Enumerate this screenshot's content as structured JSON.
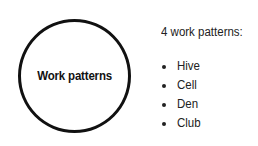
{
  "diagram": {
    "center_node": {
      "label": "Work patterns",
      "shape": "circle",
      "border_color": "#111111"
    },
    "heading": "4 work patterns:",
    "items": [
      {
        "label": "Hive"
      },
      {
        "label": "Cell"
      },
      {
        "label": "Den"
      },
      {
        "label": "Club"
      }
    ]
  }
}
